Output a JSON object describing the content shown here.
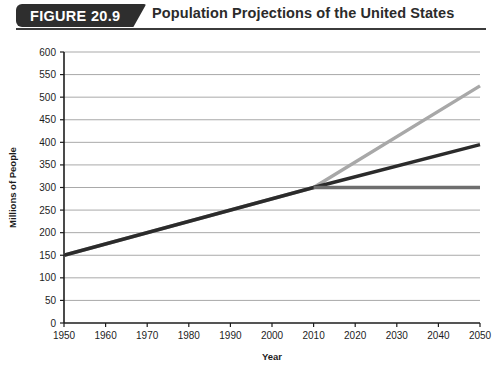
{
  "header": {
    "badge_label": "FIGURE 20.9",
    "title": "Population Projections of the United States"
  },
  "colors": {
    "badge_background": "#2e2e2e",
    "header_rule": "#3b3b3b",
    "axis": "#1d1d1d",
    "gridline": "#a9a9a9",
    "high_series": "#a8a8a8",
    "middle_series": "#2b2b2b",
    "low_series": "#6e6e6e",
    "page_background": "#ffffff"
  },
  "chart_data": {
    "type": "line",
    "title": "Population Projections of the United States",
    "xlabel": "Year",
    "ylabel": "Millions of People",
    "xlim": [
      1950,
      2050
    ],
    "ylim": [
      0,
      600
    ],
    "ytick_step": 50,
    "xtick_step": 10,
    "grid": true,
    "legend_position": "none",
    "xticks": [
      1950,
      1960,
      1970,
      1980,
      1990,
      2000,
      2010,
      2020,
      2030,
      2040,
      2050
    ],
    "yticks": [
      0,
      50,
      100,
      150,
      200,
      250,
      300,
      350,
      400,
      450,
      500,
      550,
      600
    ],
    "series": [
      {
        "name": "High projection",
        "color": "#a8a8a8",
        "x": [
          1950,
          2010,
          2050
        ],
        "values": [
          150,
          300,
          525
        ]
      },
      {
        "name": "Middle projection",
        "color": "#2b2b2b",
        "x": [
          1950,
          2010,
          2050
        ],
        "values": [
          150,
          300,
          395
        ]
      },
      {
        "name": "Low projection",
        "color": "#6e6e6e",
        "x": [
          2010,
          2050
        ],
        "values": [
          300,
          300
        ]
      }
    ]
  }
}
